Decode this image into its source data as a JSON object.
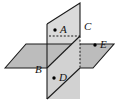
{
  "figure": {
    "type": "geometry-diagram",
    "width": 119,
    "height": 104,
    "background_color": "#ffffff",
    "colors": {
      "horizontal_plane_fill": "#bfbfbf",
      "vertical_plane_fill": "#d9d9d9",
      "vertical_plane_lower_fill": "#cfcfcf",
      "outline": "#1a1a1a",
      "hidden_line": "#1a1a1a",
      "label_text": "#111111",
      "point_dot": "#000000"
    },
    "shapes": {
      "horizontal_plane": {
        "name": "horizontal-plane",
        "points": "5,68 26,44 114,44 93,68"
      },
      "vertical_plane": {
        "name": "vertical-plane",
        "points": "80,3 80,99 47,99 47,24"
      },
      "vertical_plane_upper": {
        "name": "vertical-plane-upper-part",
        "points": "80,3 80,44 47,44 47,24"
      },
      "vertical_plane_lower": {
        "name": "vertical-plane-lower-part",
        "points": "80,44 80,99 47,99 47,44"
      }
    },
    "lines": {
      "hidden_dashed_horizontal": {
        "name": "hidden-edge-dashed-horizontal",
        "x1": 50,
        "y1": 36,
        "x2": 80,
        "y2": 36
      },
      "hidden_dashed_vertical": {
        "name": "hidden-edge-dashed-vertical",
        "x1": 80,
        "y1": 36,
        "x2": 80,
        "y2": 68
      },
      "intersection_line": {
        "name": "plane-intersection-line",
        "x1": 47,
        "y1": 68,
        "x2": 80,
        "y2": 36
      }
    },
    "points": [
      {
        "id": "A",
        "label": "A",
        "dot_x": 55,
        "dot_y": 30,
        "label_x": 60,
        "label_y": 25,
        "location": "upper-vertical-plane"
      },
      {
        "id": "B",
        "label": "B",
        "dot_x": 47,
        "dot_y": 68,
        "label_x": 36,
        "label_y": 66,
        "location": "intersection-corner",
        "has_dot": false
      },
      {
        "id": "C",
        "label": "C",
        "dot_x": 80,
        "dot_y": 36,
        "label_x": 84,
        "label_y": 22,
        "location": "upper-right-vertical-plane",
        "has_dot": false
      },
      {
        "id": "D",
        "label": "D",
        "dot_x": 54,
        "dot_y": 78,
        "label_x": 59,
        "label_y": 73,
        "location": "lower-vertical-plane"
      },
      {
        "id": "E",
        "label": "E",
        "dot_x": 95,
        "dot_y": 45,
        "label_x": 100,
        "label_y": 40,
        "location": "horizontal-plane-right"
      }
    ]
  }
}
